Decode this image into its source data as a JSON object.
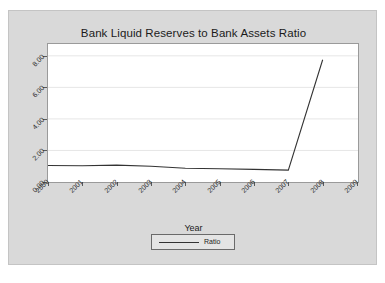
{
  "chart_data": {
    "type": "line",
    "title": "Bank Liquid Reserves to Bank Assets Ratio",
    "xlabel": "Year",
    "ylabel": "",
    "grid": true,
    "legend_position": "bottom",
    "categories": [
      "2000",
      "2001",
      "2002",
      "2003",
      "2004",
      "2005",
      "2006",
      "2007",
      "2008",
      "2009"
    ],
    "x_tick_labels": [
      "2000",
      "2001",
      "2002",
      "2003",
      "2004",
      "2005",
      "2006",
      "2007",
      "2008",
      "2009"
    ],
    "y_tick_labels": [
      "0.00",
      "2.00",
      "4.00",
      "6.00",
      "8.00"
    ],
    "y_tick_values": [
      0,
      2,
      4,
      6,
      8
    ],
    "ylim": [
      0,
      8.75
    ],
    "series": [
      {
        "name": "Ratio",
        "color": "#333333",
        "x": [
          "2000",
          "2001",
          "2002",
          "2003",
          "2004",
          "2005",
          "2006",
          "2007",
          "2008"
        ],
        "values": [
          1.05,
          1.03,
          1.07,
          1.0,
          0.87,
          0.84,
          0.8,
          0.75,
          7.75
        ]
      }
    ],
    "legend": [
      {
        "label": "Ratio",
        "color": "#333333"
      }
    ]
  },
  "colors": {
    "panel_background": "#d9d9d9",
    "plot_background": "#ffffff",
    "line": "#333333",
    "grid": "#e6e6e6",
    "axis": "#5a5a5a",
    "text": "#1b1b1b"
  }
}
